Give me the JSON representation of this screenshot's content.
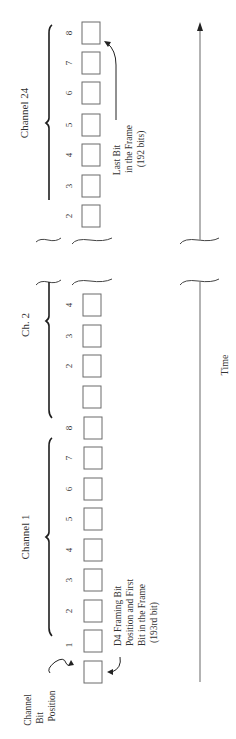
{
  "diagram": {
    "orientation": "rotated-90-ccw",
    "channels": [
      {
        "label": "Channel 24",
        "bits": [
          "2",
          "3",
          "4",
          "5",
          "6",
          "7",
          "8"
        ]
      },
      {
        "label": "Ch. 2",
        "bits": [
          "1",
          "2",
          "3",
          "4"
        ]
      },
      {
        "label": "Channel 1",
        "bits": [
          "1",
          "2",
          "3",
          "4",
          "5",
          "6",
          "7",
          "8"
        ]
      }
    ],
    "framing_bit": {
      "label": "D4 Framing Bit",
      "line2": "Position and First",
      "line3": "Bit in the Frame",
      "line4": "(193rd bit)"
    },
    "last_bit": {
      "line1": "Last Bit",
      "line2": "in the Frame",
      "line3": "(192 bits)"
    },
    "channel_bit_position": {
      "line1": "Channel",
      "line2": "Bit",
      "line3": "Position"
    },
    "time_axis": {
      "label": "Time"
    },
    "colors": {
      "box_stroke": "#6b6b6b",
      "brace": "#1e1e1e",
      "axis": "#8a8a8a",
      "text": "#333333"
    }
  }
}
